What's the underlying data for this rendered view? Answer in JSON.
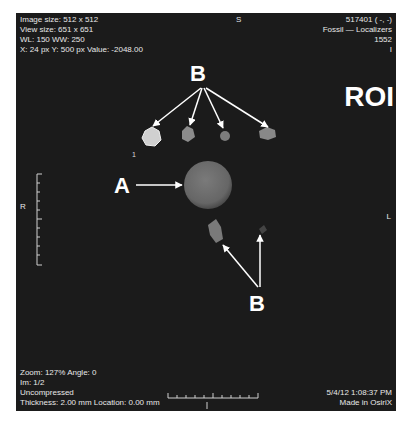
{
  "viewer": {
    "top_left": [
      "Image size: 512 x 512",
      "View size: 651 x 651",
      "WL: 150 WW: 250",
      "X: 24 px Y: 500 px Value: -2048.00"
    ],
    "top_right": [
      "517401 ( -, -)",
      "Fossil — Localizers",
      "1552",
      "I"
    ],
    "bottom_left": [
      "Zoom: 127% Angle: 0",
      "Im: 1/2",
      "Uncompressed",
      "Thickness: 2.00 mm Location: 0.00 mm"
    ],
    "bottom_right": [
      "5/4/12 1:08:37 PM",
      "Made in OsiriX"
    ],
    "orientation": {
      "top": "S",
      "left": "R",
      "right": "L"
    },
    "slice_marker": "1"
  },
  "annotations": {
    "roi_label": "ROI",
    "label_a": "A",
    "label_b_top": "B",
    "label_b_bottom": "B"
  },
  "colors": {
    "background": "#1b1b1b",
    "overlay_text": "#e8e8e8",
    "annotation": "#ffffff",
    "sphere": "#6e6e6e",
    "marker_bright": "#d8d8d8",
    "marker_mid": "#8a8a8a"
  }
}
